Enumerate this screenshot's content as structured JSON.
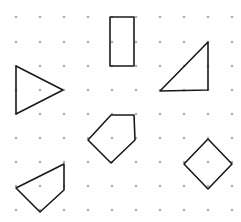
{
  "diagram": {
    "title": "",
    "background": "#ffffff",
    "dot_color": "#b0b0b0",
    "stroke_color": "#1a1a1a",
    "grid": {
      "columns_x": [
        16,
        40,
        64,
        88,
        112,
        136,
        160,
        184,
        208,
        232
      ],
      "rows_y": [
        17,
        42,
        66,
        90,
        114,
        138,
        162,
        186,
        210
      ],
      "dot_radius": 1.3
    },
    "shapes": [
      {
        "name": "rectangle",
        "type": "rectangle",
        "points": [
          [
            110,
            17
          ],
          [
            134,
            17
          ],
          [
            134,
            66
          ],
          [
            110,
            66
          ]
        ]
      },
      {
        "name": "right-triangle",
        "type": "triangle",
        "points": [
          [
            208,
            42
          ],
          [
            208,
            90
          ],
          [
            160,
            91
          ]
        ]
      },
      {
        "name": "isosceles-triangle",
        "type": "triangle",
        "points": [
          [
            16,
            66
          ],
          [
            63,
            90
          ],
          [
            16,
            114
          ]
        ]
      },
      {
        "name": "pentagon",
        "type": "pentagon",
        "points": [
          [
            111,
            115
          ],
          [
            134,
            115
          ],
          [
            135,
            140
          ],
          [
            111,
            163
          ],
          [
            88,
            140
          ]
        ]
      },
      {
        "name": "quadrilateral",
        "type": "quadrilateral",
        "points": [
          [
            64,
            164
          ],
          [
            64,
            190
          ],
          [
            40,
            212
          ],
          [
            16,
            188
          ]
        ]
      },
      {
        "name": "square-diamond",
        "type": "square",
        "points": [
          [
            208,
            139
          ],
          [
            232,
            164
          ],
          [
            208,
            189
          ],
          [
            184,
            164
          ]
        ]
      }
    ]
  }
}
